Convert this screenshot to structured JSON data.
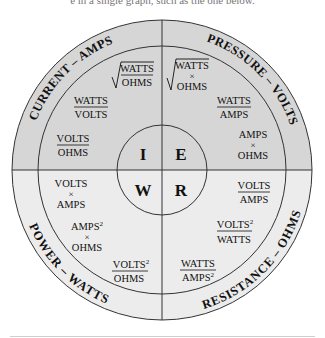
{
  "page": {
    "cropped_top_text": "e in a single graph, such as the one below."
  },
  "colors": {
    "top_half_fill": "#d6d6d6",
    "bottom_half_fill": "#ececec",
    "line": "#333333",
    "text": "#111111"
  },
  "center": {
    "I": "I",
    "E": "E",
    "W": "W",
    "R": "R"
  },
  "rings": {
    "current": "CURRENT – AMPS",
    "pressure": "PRESSURE – VOLTS",
    "power": "POWER – WATTS",
    "resistance": "RESISTANCE – OHMS"
  },
  "current": {
    "f1": {
      "type": "sqrt_fraction",
      "num": "WATTS",
      "den": "OHMS"
    },
    "f2": {
      "type": "fraction",
      "num": "WATTS",
      "den": "VOLTS"
    },
    "f3": {
      "type": "fraction",
      "num": "VOLTS",
      "den": "OHMS"
    }
  },
  "pressure": {
    "f1": {
      "type": "sqrt_product",
      "a": "WATTS",
      "op": "×",
      "b": "OHMS"
    },
    "f2": {
      "type": "fraction",
      "num": "WATTS",
      "den": "AMPS"
    },
    "f3": {
      "type": "product",
      "a": "AMPS",
      "op": "×",
      "b": "OHMS"
    }
  },
  "power": {
    "f1": {
      "type": "product",
      "a": "VOLTS",
      "op": "×",
      "b": "AMPS"
    },
    "f2": {
      "type": "product",
      "a": "AMPS",
      "a_sup": "2",
      "op": "×",
      "b": "OHMS"
    },
    "f3": {
      "type": "fraction",
      "num": "VOLTS",
      "num_sup": "2",
      "den": "OHMS"
    }
  },
  "resistance": {
    "f1": {
      "type": "fraction",
      "num": "VOLTS",
      "den": "AMPS"
    },
    "f2": {
      "type": "fraction",
      "num": "VOLTS",
      "num_sup": "2",
      "den": "WATTS"
    },
    "f3": {
      "type": "fraction",
      "num": "WATTS",
      "den": "AMPS",
      "den_sup": "2"
    }
  }
}
